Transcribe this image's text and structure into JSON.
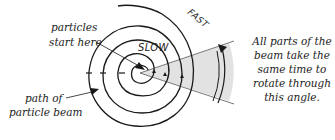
{
  "labels": {
    "particles_start": [
      "particles",
      "start here"
    ],
    "path_of_beam": [
      "path of",
      "particle beam"
    ],
    "slow": "SLOW",
    "fast": "FAST",
    "explanation": [
      "All parts of the",
      "beam take the",
      "same time to",
      "rotate through",
      "this angle."
    ]
  },
  "colors": {
    "stroke": "#1a1a1a",
    "wedge_fill": "#e2e2e2",
    "guide": "#555555"
  }
}
